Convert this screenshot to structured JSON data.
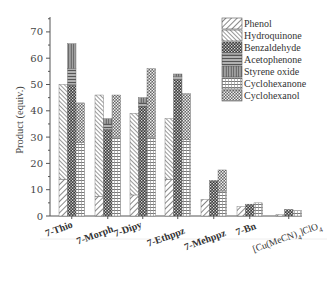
{
  "chart_data": {
    "type": "bar",
    "stacked": true,
    "title": "",
    "xlabel": "",
    "ylabel": "Product (equiv.)",
    "ylim": [
      0,
      75
    ],
    "yticks": [
      0,
      10,
      20,
      30,
      40,
      50,
      60,
      70
    ],
    "grid": false,
    "legend_position": "top-right",
    "categories": [
      "7-Thio",
      "7-Morph",
      "7-Dipy",
      "7-Ethppz",
      "7-Mehppz",
      "7-Bn",
      "[Cu(MeCN)4]ClO4"
    ],
    "stacks": [
      {
        "bar": 1,
        "series": [
          "Phenol",
          "Hydroquinone"
        ]
      },
      {
        "bar": 2,
        "series": [
          "Benzaldehyde",
          "Acetophenone",
          "Styrene oxide"
        ]
      },
      {
        "bar": 3,
        "series": [
          "Cyclohexanone",
          "Cyclohexanol"
        ]
      }
    ],
    "series": [
      {
        "name": "Phenol",
        "bar": 1,
        "values": [
          14,
          7.5,
          8,
          14,
          6.3,
          3.5,
          0.5
        ]
      },
      {
        "name": "Hydroquinone",
        "bar": 1,
        "values": [
          36,
          38.5,
          31,
          23,
          0,
          0,
          0
        ]
      },
      {
        "name": "Benzaldehyde",
        "bar": 2,
        "values": [
          50,
          33,
          41.5,
          52,
          13.5,
          4.5,
          2.5
        ]
      },
      {
        "name": "Acetophenone",
        "bar": 2,
        "values": [
          6,
          2,
          1.5,
          1,
          0,
          0,
          0
        ]
      },
      {
        "name": "Styrene oxide",
        "bar": 2,
        "values": [
          9.5,
          2,
          2,
          1,
          0,
          0,
          0
        ]
      },
      {
        "name": "Cyclohexanone",
        "bar": 3,
        "values": [
          28,
          30,
          30,
          29,
          9.5,
          5,
          2
        ]
      },
      {
        "name": "Cyclohexanol",
        "bar": 3,
        "values": [
          15,
          16,
          26,
          17.5,
          8,
          0,
          0
        ]
      }
    ]
  },
  "axis": {
    "y_title": "Product (equiv.)",
    "y_ticks": [
      "0",
      "10",
      "20",
      "30",
      "40",
      "50",
      "60",
      "70"
    ]
  },
  "legend": {
    "items": [
      "Phenol",
      "Hydroquinone",
      "Benzaldehyde",
      "Acetophenone",
      "Styrene oxide",
      "Cyclohexanone",
      "Cyclohexanol"
    ]
  },
  "categories": {
    "labels": [
      "7-Thio",
      "7-Morph",
      "7-Dipy",
      "7-Ethppz",
      "7-Mehppz",
      "7-Bn"
    ],
    "cu_label_main": "[Cu(MeCN)",
    "cu_label_sub1": "4",
    "cu_label_mid": "]ClO",
    "cu_label_sub2": "4"
  }
}
